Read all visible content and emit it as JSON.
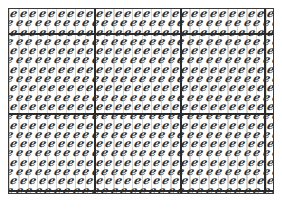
{
  "canvas": {
    "width": 282,
    "height": 210,
    "background_color": "#ffffff"
  },
  "frame": {
    "label": "pattern-frame",
    "border_color": "#3a3a3a",
    "fill_color": "#ffffff",
    "left": 8,
    "top": 8,
    "width": 266,
    "height": 186
  },
  "pattern": {
    "description": "dense tiled field of repeated small slanted italic glyphs",
    "glyph": "e",
    "glyph_color": "#2e2e2e",
    "hatch_color": "#787878",
    "columns": 28,
    "rows": 20,
    "cell_width": 9.5,
    "cell_height": 9.3,
    "skew_degrees": -12
  },
  "grid": {
    "divider_color": "#2b2b2b",
    "divider_thickness": 2,
    "vertical_dividers": [
      {
        "name": "divider-v-1",
        "x": 85
      },
      {
        "name": "divider-v-2",
        "x": 171
      },
      {
        "name": "divider-v-3",
        "x": 255
      }
    ],
    "horizontal_dividers": [
      {
        "name": "divider-h-1",
        "y": 24
      },
      {
        "name": "divider-h-2",
        "y": 104
      },
      {
        "name": "divider-h-3",
        "y": 181
      }
    ]
  }
}
